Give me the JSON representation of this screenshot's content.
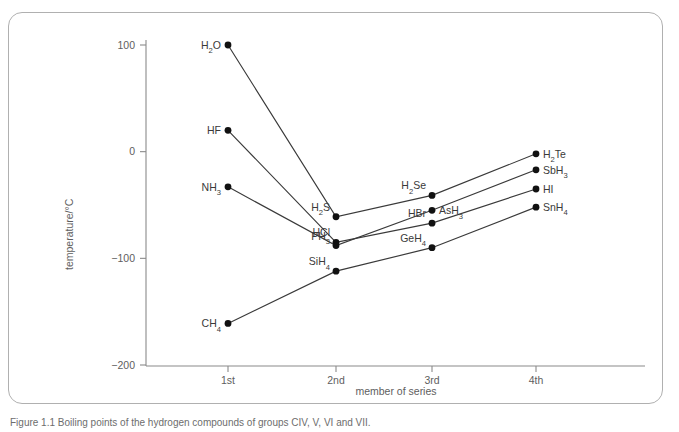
{
  "figure": {
    "caption": "Figure 1.1  Boiling points of the hydrogen compounds of groups CIV, V, VI and VII."
  },
  "chart_data": {
    "type": "line",
    "title": "",
    "xlabel": "member of series",
    "ylabel": "temperature/°C",
    "categories": [
      "1st",
      "2nd",
      "3rd",
      "4th"
    ],
    "x_tick_labels": [
      "1st",
      "2nd",
      "3rd",
      "4th"
    ],
    "y_tick_labels": [
      "100",
      "0",
      "−100",
      "−200"
    ],
    "y_tick_values": [
      100,
      0,
      -100,
      -200
    ],
    "ylim": [
      -200,
      130
    ],
    "grid": false,
    "legend": "none",
    "series": [
      {
        "name": "group VI hydrides",
        "values": [
          100,
          -61,
          -41,
          -2
        ],
        "point_labels": [
          "H2O",
          "H2S",
          "H2Se",
          "H2Te"
        ],
        "point_labels_display": [
          {
            "base": "H",
            "sub": "2",
            "tail": "O"
          },
          {
            "base": "H",
            "sub": "2",
            "tail": "S"
          },
          {
            "base": "H",
            "sub": "2",
            "tail": "Se"
          },
          {
            "base": "H",
            "sub": "2",
            "tail": "Te"
          }
        ],
        "label_side": [
          "left",
          "left",
          "left",
          "right"
        ]
      },
      {
        "name": "group VII hydrides",
        "values": [
          20,
          -85,
          -67,
          -35
        ],
        "point_labels": [
          "HF",
          "HCl",
          "HBr",
          "HI"
        ],
        "point_labels_display": [
          {
            "base": "HF",
            "sub": "",
            "tail": ""
          },
          {
            "base": "HCl",
            "sub": "",
            "tail": ""
          },
          {
            "base": "HBr",
            "sub": "",
            "tail": ""
          },
          {
            "base": "HI",
            "sub": "",
            "tail": ""
          }
        ],
        "label_side": [
          "left",
          "left",
          "left",
          "right"
        ]
      },
      {
        "name": "group V hydrides",
        "values": [
          -33,
          -88,
          -55,
          -17
        ],
        "point_labels": [
          "NH3",
          "PH3",
          "AsH3",
          "SbH3"
        ],
        "point_labels_display": [
          {
            "base": "NH",
            "sub": "3",
            "tail": ""
          },
          {
            "base": "PH",
            "sub": "3",
            "tail": ""
          },
          {
            "base": "AsH",
            "sub": "3",
            "tail": ""
          },
          {
            "base": "SbH",
            "sub": "3",
            "tail": ""
          }
        ],
        "label_side": [
          "left",
          "left",
          "right",
          "right"
        ]
      },
      {
        "name": "group IV hydrides",
        "values": [
          -161,
          -112,
          -90,
          -52
        ],
        "point_labels": [
          "CH4",
          "SiH4",
          "GeH4",
          "SnH4"
        ],
        "point_labels_display": [
          {
            "base": "CH",
            "sub": "4",
            "tail": ""
          },
          {
            "base": "SiH",
            "sub": "4",
            "tail": ""
          },
          {
            "base": "GeH",
            "sub": "4",
            "tail": ""
          },
          {
            "base": "SnH",
            "sub": "4",
            "tail": ""
          }
        ],
        "label_side": [
          "left",
          "left",
          "left",
          "right"
        ]
      }
    ]
  },
  "colors": {
    "frame_border": "#b0b0b0",
    "axis": "#8a8a8a",
    "tick_text": "#5e5e5e",
    "series_line": "#3a3a3a",
    "point_fill": "#111111",
    "label_text": "#3a3a3a",
    "background": "#ffffff"
  }
}
